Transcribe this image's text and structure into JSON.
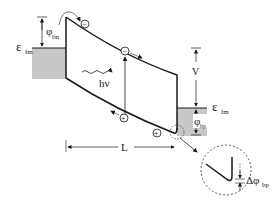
{
  "diagram": {
    "labels": {
      "fermi_left": "ε",
      "fermi_left_sub": "fm",
      "phi_bn": "φ",
      "phi_bn_sub": "bn",
      "photon": "hν",
      "voltage": "V",
      "fermi_right": "ε",
      "fermi_right_sub": "fm",
      "phi_bp": "φ",
      "phi_bp_sub": "bp",
      "length": "L",
      "delta_phi_bp": "Δφ",
      "delta_phi_bp_sub": "bp"
    },
    "carriers": {
      "electron_symbol": "−",
      "hole_symbol": "+"
    },
    "colors": {
      "metal_fill": "#c8c8c8",
      "line": "#1a1a1a"
    }
  }
}
